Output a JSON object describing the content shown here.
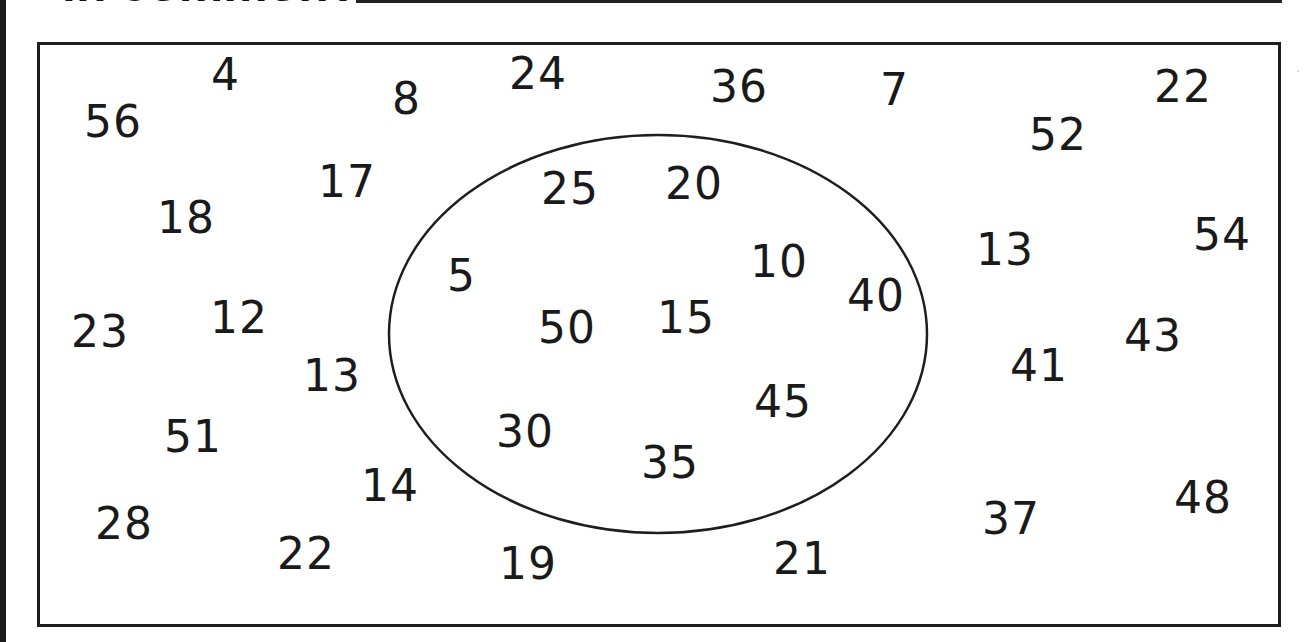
{
  "heading": {
    "text": "in common?"
  },
  "ellipse": {
    "cx": 658,
    "cy": 334,
    "rx": 269,
    "ry": 199,
    "label": "set-circle"
  },
  "outside_numbers": [
    {
      "value": "56",
      "x": 84,
      "y": 100
    },
    {
      "value": "4",
      "x": 211,
      "y": 53
    },
    {
      "value": "8",
      "x": 392,
      "y": 77
    },
    {
      "value": "24",
      "x": 509,
      "y": 52
    },
    {
      "value": "36",
      "x": 710,
      "y": 65
    },
    {
      "value": "7",
      "x": 880,
      "y": 68
    },
    {
      "value": "22",
      "x": 1154,
      "y": 65
    },
    {
      "value": "52",
      "x": 1029,
      "y": 113
    },
    {
      "value": "17",
      "x": 318,
      "y": 160
    },
    {
      "value": "18",
      "x": 157,
      "y": 196
    },
    {
      "value": "13",
      "x": 976,
      "y": 228
    },
    {
      "value": "54",
      "x": 1193,
      "y": 213
    },
    {
      "value": "23",
      "x": 71,
      "y": 310
    },
    {
      "value": "12",
      "x": 210,
      "y": 296
    },
    {
      "value": "43",
      "x": 1124,
      "y": 314
    },
    {
      "value": "13",
      "x": 303,
      "y": 354
    },
    {
      "value": "41",
      "x": 1010,
      "y": 344
    },
    {
      "value": "51",
      "x": 164,
      "y": 415
    },
    {
      "value": "14",
      "x": 361,
      "y": 464
    },
    {
      "value": "28",
      "x": 95,
      "y": 502
    },
    {
      "value": "22",
      "x": 277,
      "y": 532
    },
    {
      "value": "19",
      "x": 499,
      "y": 542
    },
    {
      "value": "21",
      "x": 773,
      "y": 537
    },
    {
      "value": "37",
      "x": 982,
      "y": 497
    },
    {
      "value": "48",
      "x": 1174,
      "y": 476
    }
  ],
  "inside_numbers": [
    {
      "value": "25",
      "x": 541,
      "y": 167
    },
    {
      "value": "20",
      "x": 665,
      "y": 162
    },
    {
      "value": "5",
      "x": 447,
      "y": 254
    },
    {
      "value": "10",
      "x": 750,
      "y": 240
    },
    {
      "value": "40",
      "x": 847,
      "y": 274
    },
    {
      "value": "50",
      "x": 538,
      "y": 306
    },
    {
      "value": "15",
      "x": 657,
      "y": 296
    },
    {
      "value": "45",
      "x": 754,
      "y": 380
    },
    {
      "value": "30",
      "x": 496,
      "y": 410
    },
    {
      "value": "35",
      "x": 641,
      "y": 441
    }
  ],
  "colors": {
    "ink": "#1a1a1a",
    "background": "#ffffff"
  }
}
